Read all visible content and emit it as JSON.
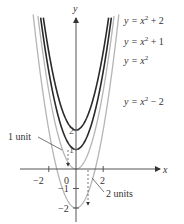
{
  "chart_data": {
    "type": "line",
    "title": "",
    "xlabel": "x",
    "ylabel": "y",
    "x_ticks": [
      -2,
      0,
      2
    ],
    "y_ticks": [
      -2,
      -1,
      1,
      2
    ],
    "x_tick_labels": [
      "−2",
      "0",
      "2"
    ],
    "y_tick_labels": [
      "−2",
      "−1",
      "1",
      "2"
    ],
    "xlim": [
      -2.8,
      3
    ],
    "ylim": [
      -2.7,
      7.8
    ],
    "grid": false,
    "series": [
      {
        "name": "y = x² + 2",
        "base": "x^2",
        "shift": 2,
        "color": "#2b2b2b",
        "vertex": [
          0,
          2
        ]
      },
      {
        "name": "y = x² + 1",
        "base": "x^2",
        "shift": 1,
        "color": "#2b2b2b",
        "vertex": [
          0,
          1
        ]
      },
      {
        "name": "y = x²",
        "base": "x^2",
        "shift": 0,
        "color": "#b5b5b5",
        "vertex": [
          0,
          0
        ]
      },
      {
        "name": "y = x² − 2",
        "base": "x^2",
        "shift": -2,
        "color": "#b5b5b5",
        "vertex": [
          0,
          -2
        ]
      }
    ],
    "annotations": [
      {
        "text": "1 unit",
        "points_to": "shift from y = x² + 1 down to y = x²"
      },
      {
        "text": "2 units",
        "points_to": "shift from y = x² down to y = x² − 2"
      }
    ]
  },
  "labels": {
    "axis_x": "x",
    "axis_y": "y",
    "curve1_a": "y = x",
    "curve1_b": " + 2",
    "curve2_a": "y = x",
    "curve2_b": " + 1",
    "curve3_a": "y = x",
    "curve4_a": "y = x",
    "curve4_b": " − 2",
    "sup": "2",
    "tick_xm2": "−2",
    "tick_x0": "0",
    "tick_x2": "2",
    "tick_y1": "1",
    "tick_y2": "2",
    "tick_ym1": "−1",
    "tick_ym2": "−2",
    "ann1": "1 unit",
    "ann2": "2 units"
  }
}
